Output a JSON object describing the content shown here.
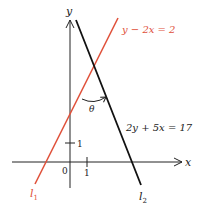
{
  "diagram": {
    "axes": {
      "x_label": "x",
      "y_label": "y",
      "origin_label": "0",
      "x_tick_label": "1",
      "y_tick_label": "1"
    },
    "lines": [
      {
        "id": "l1",
        "label": "l",
        "subscript": "1",
        "equation": "y − 2x = 2",
        "color": "#e0503a"
      },
      {
        "id": "l2",
        "label": "l",
        "subscript": "2",
        "equation": "2y + 5x = 17",
        "color": "#111111"
      }
    ],
    "angle": {
      "label": "θ"
    }
  }
}
